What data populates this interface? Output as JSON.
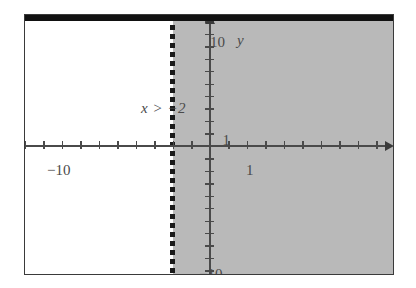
{
  "figure": {
    "annotation": "x > −2"
  },
  "axes": {
    "x_axis_name": "x",
    "y_axis_name": "y",
    "x_left_label": "−10",
    "x_one_label": "1",
    "x_right_label": "10",
    "y_top_label": "10",
    "y_one_label": "1",
    "y_bottom_label": "−10"
  },
  "colors": {
    "shaded_region": "#b9b9b9",
    "axis": "#4a4a4a",
    "frame": "#3a3a3a",
    "boundary_line": "#1a1a1a",
    "top_bar": "#111111",
    "background": "#ffffff"
  },
  "chart_data": {
    "type": "line",
    "title": "",
    "subtitle": "",
    "xlabel": "x",
    "ylabel": "y",
    "xlim": [
      -10,
      10
    ],
    "ylim": [
      -10,
      10
    ],
    "xticks": [
      -10,
      -9,
      -8,
      -7,
      -6,
      -5,
      -4,
      -3,
      -2,
      -1,
      0,
      1,
      2,
      3,
      4,
      5,
      6,
      7,
      8,
      9,
      10
    ],
    "yticks": [
      -10,
      -9,
      -8,
      -7,
      -6,
      -5,
      -4,
      -3,
      -2,
      -1,
      0,
      1,
      2,
      3,
      4,
      5,
      6,
      7,
      8,
      9,
      10
    ],
    "xtick_labels": [
      "−10",
      "1",
      "10"
    ],
    "ytick_labels": [
      "10",
      "1",
      "−10"
    ],
    "grid": false,
    "legend": false,
    "annotations": [
      {
        "text": "x > −2",
        "x": -4.6,
        "y": 4.6
      }
    ],
    "series": [
      {
        "name": "boundary x = −2",
        "type": "vertical-line",
        "style": "dotted",
        "x": -2,
        "included": false
      },
      {
        "name": "solution region x > −2",
        "type": "shaded-halfplane",
        "inequality": "x > -2",
        "x_from": -2,
        "x_to": 10,
        "y_from": -10,
        "y_to": 10,
        "fill": "#b9b9b9"
      }
    ]
  }
}
